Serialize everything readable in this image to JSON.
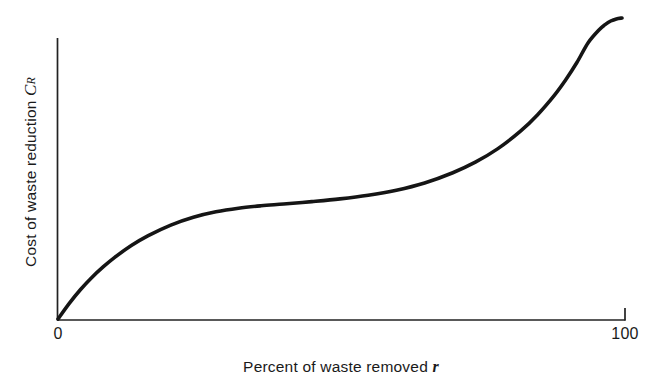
{
  "chart_data": {
    "type": "line",
    "title": "",
    "subtitle": "",
    "xlabel": "Percent of waste removed r",
    "xlabel_text": "Percent of waste removed",
    "xlabel_variable": "r",
    "ylabel": "Cost of waste reduction C_R",
    "ylabel_text": "Cost of waste reduction",
    "ylabel_variable": "C",
    "ylabel_variable_subscript": "R",
    "xticklabels": [
      "0",
      "100"
    ],
    "yticklabels": [],
    "xlim": [
      0,
      100
    ],
    "ylim": [
      0,
      1
    ],
    "grid": false,
    "legend": false,
    "legend_position": "none",
    "annotations": [],
    "series": [
      {
        "name": "Cost of waste reduction",
        "color": "#151515",
        "linewidth": 3.6,
        "x": [
          0,
          2,
          4,
          6,
          8,
          10,
          13,
          16,
          20,
          24,
          28,
          32,
          36,
          40,
          45,
          50,
          55,
          60,
          65,
          70,
          74,
          78,
          82,
          85,
          88,
          90,
          92,
          94,
          96,
          97,
          98,
          99,
          100
        ],
        "y": [
          0.0,
          0.052,
          0.098,
          0.138,
          0.173,
          0.204,
          0.244,
          0.277,
          0.312,
          0.338,
          0.356,
          0.368,
          0.376,
          0.382,
          0.39,
          0.399,
          0.411,
          0.428,
          0.452,
          0.486,
          0.521,
          0.566,
          0.624,
          0.678,
          0.743,
          0.794,
          0.852,
          0.918,
          0.962,
          0.978,
          0.99,
          0.997,
          1.0
        ]
      }
    ]
  },
  "axes": {
    "x_axis_name": "x-axis-line",
    "y_axis_name": "y-axis-line",
    "end_tick_value": "100",
    "origin_value": "0"
  },
  "colors": {
    "background": "#ffffff",
    "axis": "#222222",
    "curve": "#151515",
    "text": "#1a1a1a"
  }
}
